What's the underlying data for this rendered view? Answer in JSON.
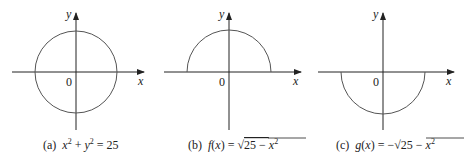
{
  "figure": {
    "panels": [
      {
        "id": "a",
        "x_axis_label": "x",
        "y_axis_label": "y",
        "origin_label": "0",
        "curve": "full circle",
        "caption_prefix": "(a)",
        "caption": "(a) x² + y² = 25"
      },
      {
        "id": "b",
        "x_axis_label": "x",
        "y_axis_label": "y",
        "origin_label": "0",
        "curve": "upper semicircle",
        "caption_prefix": "(b)",
        "caption": "(b) f(x) = √(25 − x²)"
      },
      {
        "id": "c",
        "x_axis_label": "x",
        "y_axis_label": "y",
        "origin_label": "0",
        "curve": "lower semicircle",
        "caption_prefix": "(c)",
        "caption": "(c) g(x) = −√(25 − x²)"
      }
    ],
    "colors": {
      "axis": "#222222",
      "curve": "#555555"
    }
  }
}
